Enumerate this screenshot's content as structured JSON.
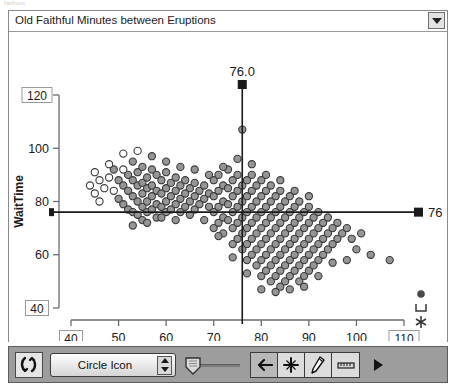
{
  "window": {
    "title": "Old Faithful Minutes between Eruptions",
    "ghost_text": "fathom",
    "menu_icon": "chevron-down-icon"
  },
  "toolbar": {
    "refresh_icon": "rerandomize-icon",
    "icon_select_value": "Circle Icon",
    "stepper_icon": "stepper-arrows-icon",
    "slider_icon": "shield-slider-handle-icon",
    "back_icon": "arrow-left-icon",
    "point_icon": "crosshair-plus-icon",
    "pencil_icon": "pencil-icon",
    "measure_icon": "ruler-icon",
    "play_icon": "play-triangle-icon"
  },
  "legend_markers": [
    {
      "name": "filled-circle-marker",
      "glyph": "circle"
    },
    {
      "name": "bracket-marker",
      "glyph": "bracket"
    },
    {
      "name": "asterisk-marker",
      "glyph": "asterisk"
    }
  ],
  "crosshairs": {
    "vertical_label": "76.0",
    "vertical_value": 76.0,
    "horizontal_label": "76",
    "horizontal_value": 76,
    "color": "#1a1a1a"
  },
  "colors": {
    "point_fill": "#8f8f8f",
    "point_stroke": "#3a3a3a",
    "open_point_fill": "#ffffff",
    "axis": "#6b6b6b",
    "toolbar_bg": "#9d9d9d"
  },
  "chart_data": {
    "type": "scatter",
    "title": "Old Faithful Minutes between Eruptions",
    "xlabel": "PrevTime",
    "ylabel": "WaitTime",
    "xlim": [
      40,
      110
    ],
    "ylim": [
      40,
      120
    ],
    "xticks": [
      40,
      50,
      60,
      70,
      80,
      90,
      100,
      110
    ],
    "yticks": [
      40,
      60,
      80,
      100,
      120
    ],
    "xtick_boxed": [
      40,
      110
    ],
    "ytick_boxed": [
      40,
      120
    ],
    "grid": false,
    "legend": false,
    "reference_lines": [
      {
        "orientation": "vertical",
        "value": 76.0,
        "label": "76.0"
      },
      {
        "orientation": "horizontal",
        "value": 76,
        "label": "76"
      }
    ],
    "points": [
      [
        47,
        85
      ],
      [
        48,
        89
      ],
      [
        49,
        92
      ],
      [
        50,
        88
      ],
      [
        50,
        81
      ],
      [
        51,
        86
      ],
      [
        51,
        79
      ],
      [
        52,
        90
      ],
      [
        52,
        84
      ],
      [
        52,
        77
      ],
      [
        53,
        95
      ],
      [
        53,
        88
      ],
      [
        53,
        82
      ],
      [
        53,
        76
      ],
      [
        54,
        91
      ],
      [
        54,
        86
      ],
      [
        54,
        80
      ],
      [
        54,
        75
      ],
      [
        55,
        93
      ],
      [
        55,
        87
      ],
      [
        55,
        83
      ],
      [
        55,
        78
      ],
      [
        55,
        73
      ],
      [
        56,
        89
      ],
      [
        56,
        85
      ],
      [
        56,
        80
      ],
      [
        56,
        76
      ],
      [
        57,
        92
      ],
      [
        57,
        86
      ],
      [
        57,
        82
      ],
      [
        57,
        77
      ],
      [
        58,
        90
      ],
      [
        58,
        84
      ],
      [
        58,
        79
      ],
      [
        58,
        74
      ],
      [
        59,
        88
      ],
      [
        59,
        83
      ],
      [
        59,
        78
      ],
      [
        60,
        91
      ],
      [
        60,
        85
      ],
      [
        60,
        80
      ],
      [
        60,
        76
      ],
      [
        61,
        87
      ],
      [
        61,
        82
      ],
      [
        61,
        77
      ],
      [
        62,
        89
      ],
      [
        62,
        84
      ],
      [
        62,
        79
      ],
      [
        63,
        86
      ],
      [
        63,
        81
      ],
      [
        63,
        76
      ],
      [
        64,
        88
      ],
      [
        64,
        83
      ],
      [
        64,
        78
      ],
      [
        65,
        85
      ],
      [
        65,
        80
      ],
      [
        66,
        87
      ],
      [
        66,
        82
      ],
      [
        66,
        77
      ],
      [
        67,
        84
      ],
      [
        67,
        79
      ],
      [
        68,
        86
      ],
      [
        68,
        81
      ],
      [
        69,
        83
      ],
      [
        69,
        78
      ],
      [
        70,
        88
      ],
      [
        70,
        82
      ],
      [
        70,
        76
      ],
      [
        70,
        70
      ],
      [
        71,
        90
      ],
      [
        71,
        84
      ],
      [
        71,
        78
      ],
      [
        71,
        72
      ],
      [
        72,
        86
      ],
      [
        72,
        80
      ],
      [
        72,
        74
      ],
      [
        72,
        68
      ],
      [
        73,
        92
      ],
      [
        73,
        85
      ],
      [
        73,
        79
      ],
      [
        73,
        73
      ],
      [
        74,
        88
      ],
      [
        74,
        82
      ],
      [
        74,
        76
      ],
      [
        74,
        70
      ],
      [
        74,
        64
      ],
      [
        75,
        90
      ],
      [
        75,
        84
      ],
      [
        75,
        78
      ],
      [
        75,
        72
      ],
      [
        75,
        66
      ],
      [
        76,
        107
      ],
      [
        76,
        86
      ],
      [
        76,
        80
      ],
      [
        76,
        74
      ],
      [
        76,
        68
      ],
      [
        76,
        62
      ],
      [
        77,
        88
      ],
      [
        77,
        82
      ],
      [
        77,
        76
      ],
      [
        77,
        70
      ],
      [
        77,
        64
      ],
      [
        77,
        58
      ],
      [
        78,
        90
      ],
      [
        78,
        84
      ],
      [
        78,
        78
      ],
      [
        78,
        72
      ],
      [
        78,
        66
      ],
      [
        78,
        60
      ],
      [
        79,
        86
      ],
      [
        79,
        80
      ],
      [
        79,
        74
      ],
      [
        79,
        68
      ],
      [
        79,
        62
      ],
      [
        79,
        56
      ],
      [
        80,
        88
      ],
      [
        80,
        82
      ],
      [
        80,
        76
      ],
      [
        80,
        70
      ],
      [
        80,
        64
      ],
      [
        80,
        58
      ],
      [
        80,
        52
      ],
      [
        81,
        84
      ],
      [
        81,
        78
      ],
      [
        81,
        72
      ],
      [
        81,
        66
      ],
      [
        81,
        60
      ],
      [
        81,
        54
      ],
      [
        82,
        86
      ],
      [
        82,
        80
      ],
      [
        82,
        74
      ],
      [
        82,
        68
      ],
      [
        82,
        62
      ],
      [
        82,
        56
      ],
      [
        82,
        50
      ],
      [
        83,
        82
      ],
      [
        83,
        76
      ],
      [
        83,
        70
      ],
      [
        83,
        64
      ],
      [
        83,
        58
      ],
      [
        83,
        52
      ],
      [
        84,
        84
      ],
      [
        84,
        78
      ],
      [
        84,
        72
      ],
      [
        84,
        66
      ],
      [
        84,
        60
      ],
      [
        84,
        54
      ],
      [
        84,
        48
      ],
      [
        85,
        80
      ],
      [
        85,
        74
      ],
      [
        85,
        68
      ],
      [
        85,
        62
      ],
      [
        85,
        56
      ],
      [
        85,
        50
      ],
      [
        86,
        82
      ],
      [
        86,
        76
      ],
      [
        86,
        70
      ],
      [
        86,
        64
      ],
      [
        86,
        58
      ],
      [
        86,
        52
      ],
      [
        87,
        78
      ],
      [
        87,
        72
      ],
      [
        87,
        66
      ],
      [
        87,
        60
      ],
      [
        87,
        54
      ],
      [
        88,
        80
      ],
      [
        88,
        74
      ],
      [
        88,
        68
      ],
      [
        88,
        62
      ],
      [
        88,
        56
      ],
      [
        88,
        50
      ],
      [
        89,
        76
      ],
      [
        89,
        70
      ],
      [
        89,
        64
      ],
      [
        89,
        58
      ],
      [
        89,
        52
      ],
      [
        90,
        78
      ],
      [
        90,
        72
      ],
      [
        90,
        66
      ],
      [
        90,
        60
      ],
      [
        90,
        54
      ],
      [
        91,
        74
      ],
      [
        91,
        68
      ],
      [
        91,
        62
      ],
      [
        91,
        56
      ],
      [
        92,
        76
      ],
      [
        92,
        70
      ],
      [
        92,
        64
      ],
      [
        92,
        58
      ],
      [
        93,
        72
      ],
      [
        93,
        66
      ],
      [
        93,
        60
      ],
      [
        94,
        74
      ],
      [
        94,
        68
      ],
      [
        94,
        62
      ],
      [
        95,
        70
      ],
      [
        95,
        64
      ],
      [
        96,
        72
      ],
      [
        96,
        66
      ],
      [
        97,
        68
      ],
      [
        98,
        70
      ],
      [
        99,
        66
      ],
      [
        100,
        62
      ],
      [
        101,
        68
      ],
      [
        103,
        60
      ],
      [
        107,
        58
      ],
      [
        44,
        86
      ],
      [
        45,
        83
      ],
      [
        46,
        88
      ],
      [
        46,
        80
      ],
      [
        49,
        84
      ],
      [
        51,
        92
      ],
      [
        53,
        71
      ],
      [
        56,
        72
      ],
      [
        59,
        74
      ],
      [
        62,
        73
      ],
      [
        65,
        75
      ],
      [
        68,
        73
      ],
      [
        71,
        67
      ],
      [
        74,
        59
      ],
      [
        77,
        53
      ],
      [
        80,
        47
      ],
      [
        83,
        46
      ],
      [
        86,
        47
      ],
      [
        89,
        48
      ],
      [
        92,
        52
      ],
      [
        95,
        57
      ],
      [
        98,
        58
      ],
      [
        87,
        84
      ],
      [
        90,
        82
      ],
      [
        84,
        88
      ],
      [
        81,
        90
      ],
      [
        78,
        94
      ],
      [
        75,
        96
      ],
      [
        72,
        93
      ],
      [
        69,
        90
      ],
      [
        66,
        92
      ],
      [
        63,
        93
      ],
      [
        60,
        95
      ],
      [
        57,
        97
      ],
      [
        54,
        99
      ],
      [
        51,
        98
      ],
      [
        48,
        94
      ],
      [
        45,
        91
      ]
    ]
  }
}
